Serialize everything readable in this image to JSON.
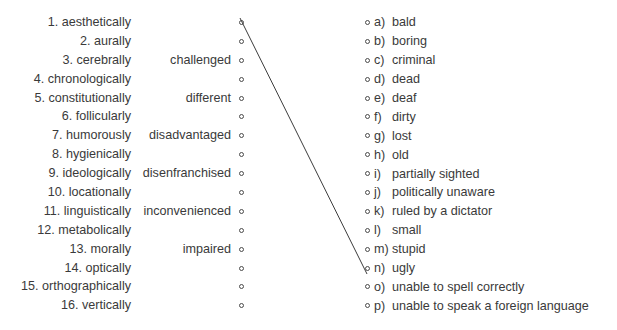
{
  "exercise": {
    "background_color": "#ffffff",
    "text_color": "#3a3a3a",
    "node_color": "#4a4a4a",
    "connector_color": "#3c3c3c"
  },
  "left_column": {
    "items": [
      {
        "number": "1.",
        "word": "aesthetically"
      },
      {
        "number": "2.",
        "word": "aurally"
      },
      {
        "number": "3.",
        "word": "cerebrally"
      },
      {
        "number": "4.",
        "word": "chronologically"
      },
      {
        "number": "5.",
        "word": "constitutionally"
      },
      {
        "number": "6.",
        "word": "follicularly"
      },
      {
        "number": "7.",
        "word": "humorously"
      },
      {
        "number": "8.",
        "word": "hygienically"
      },
      {
        "number": "9.",
        "word": "ideologically"
      },
      {
        "number": "10.",
        "word": "locationally"
      },
      {
        "number": "11.",
        "word": "linguistically"
      },
      {
        "number": "12.",
        "word": "metabolically"
      },
      {
        "number": "13.",
        "word": "morally"
      },
      {
        "number": "14.",
        "word": "optically"
      },
      {
        "number": "15.",
        "word": "orthographically"
      },
      {
        "number": "16.",
        "word": "vertically"
      }
    ],
    "labels": [
      "1. aesthetically",
      "2. aurally",
      "3. cerebrally",
      "4. chronologically",
      "5. constitutionally",
      "6. follicularly",
      "7. humorously",
      "8. hygienically",
      "9. ideologically",
      "10. locationally",
      "11. linguistically",
      "12. metabolically",
      "13. morally",
      "14. optically",
      "15. orthographically",
      "16. vertically"
    ]
  },
  "middle_column": {
    "rows": [
      "",
      "",
      "challenged",
      "",
      "different",
      "",
      "disadvantaged",
      "",
      "disenfranchised",
      "",
      "inconvenienced",
      "",
      "impaired",
      "",
      "",
      ""
    ]
  },
  "right_column": {
    "options": [
      {
        "letter": "a)",
        "text": "bald"
      },
      {
        "letter": "b)",
        "text": "boring"
      },
      {
        "letter": "c)",
        "text": "criminal"
      },
      {
        "letter": "d)",
        "text": "dead"
      },
      {
        "letter": "e)",
        "text": "deaf"
      },
      {
        "letter": "f)",
        "text": "dirty"
      },
      {
        "letter": "g)",
        "text": "lost"
      },
      {
        "letter": "h)",
        "text": "old"
      },
      {
        "letter": "i)",
        "text": "partially sighted"
      },
      {
        "letter": "j)",
        "text": "politically unaware"
      },
      {
        "letter": "k)",
        "text": "ruled by a dictator"
      },
      {
        "letter": "l)",
        "text": "small"
      },
      {
        "letter": "m)",
        "text": "stupid"
      },
      {
        "letter": "n)",
        "text": "ugly"
      },
      {
        "letter": "o)",
        "text": "unable to spell correctly"
      },
      {
        "letter": "p)",
        "text": "unable to speak a foreign language"
      }
    ]
  },
  "connections": [
    {
      "from_index": 0,
      "to_index": 13,
      "from_label": "1. aesthetically",
      "to_label": "n) ugly",
      "x1": 240,
      "y1": 18,
      "x2": 367,
      "y2": 274
    }
  ]
}
